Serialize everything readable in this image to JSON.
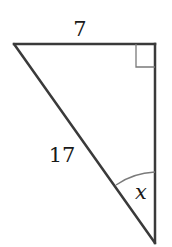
{
  "diagram": {
    "type": "right-triangle",
    "vertices": {
      "top_left": [
        14,
        44
      ],
      "right_angle": [
        155,
        44
      ],
      "bottom": [
        155,
        243
      ]
    },
    "labels": {
      "top_side": "7",
      "hypotenuse": "17",
      "angle": "x"
    },
    "colors": {
      "stroke": "#3a3a3a",
      "thin_stroke": "#7a7a7a",
      "text": "#1a1a1a"
    }
  }
}
